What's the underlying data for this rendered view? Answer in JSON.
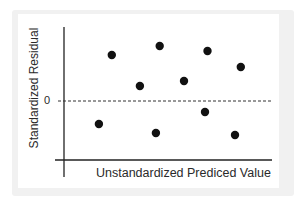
{
  "chart_data": {
    "type": "scatter",
    "title": "",
    "xlabel": "Unstandardized Prediced Value",
    "ylabel": "Standardized Residual",
    "y_tick_labels": [
      "0"
    ],
    "reference_line": {
      "y": 0,
      "style": "dashed",
      "color": "#333333"
    },
    "grid": false,
    "legend": null,
    "xlim": [
      0,
      10
    ],
    "ylim": [
      -3,
      3.5
    ],
    "points": [
      {
        "x": 2.3,
        "y": 2.3
      },
      {
        "x": 4.6,
        "y": 2.75
      },
      {
        "x": 3.65,
        "y": 0.75
      },
      {
        "x": 6.9,
        "y": 2.5
      },
      {
        "x": 8.5,
        "y": 1.7
      },
      {
        "x": 5.77,
        "y": 1.0
      },
      {
        "x": 1.68,
        "y": -1.15
      },
      {
        "x": 4.42,
        "y": -1.6
      },
      {
        "x": 6.78,
        "y": -0.55
      },
      {
        "x": 8.22,
        "y": -1.7
      }
    ],
    "marker_color": "#111111",
    "axis_color": "#222222"
  },
  "labels": {
    "ylabel": "Standardized Residual",
    "xlabel": "Unstandardized Prediced Value",
    "zero": "0"
  }
}
